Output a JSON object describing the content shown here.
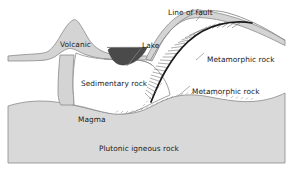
{
  "diagram": {
    "type": "cross-section",
    "canvas": {
      "width": 293,
      "height": 170
    },
    "colors": {
      "background": "#ffffff",
      "rock_fill": "#d4d4d4",
      "magma_fill": "#d9d9d9",
      "sedimentary_fill": "#ffffff",
      "outline": "#8a8a8a",
      "fault_line": "#1a1a1a",
      "lake_fill": "#4a4a4a",
      "text": "#1a1a1a",
      "leader_line": "#8a8a8a"
    },
    "labels": [
      {
        "id": "volcanic",
        "text": "Volcanic",
        "x": 60,
        "y": 41
      },
      {
        "id": "lake",
        "text": "Lake",
        "x": 142,
        "y": 42
      },
      {
        "id": "line-of-fault",
        "text": "Line of fault",
        "x": 168,
        "y": 9
      },
      {
        "id": "metamorphic-upper",
        "text": "Metamorphic rock",
        "x": 207,
        "y": 56
      },
      {
        "id": "metamorphic-lower",
        "text": "Metamorphic rock",
        "x": 192,
        "y": 88
      },
      {
        "id": "sedimentary",
        "text": "Sedimentary rock",
        "x": 81,
        "y": 80
      },
      {
        "id": "magma",
        "text": "Magma",
        "x": 78,
        "y": 116
      },
      {
        "id": "plutonic",
        "text": "Plutonic igneous rock",
        "x": 99,
        "y": 145
      }
    ]
  }
}
